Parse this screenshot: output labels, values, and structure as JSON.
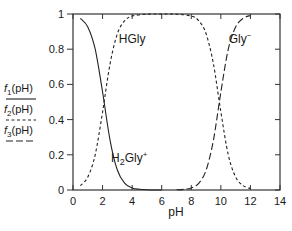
{
  "chart_data": {
    "type": "line",
    "title": "",
    "xlabel": "pH",
    "ylabel": "",
    "xlim": [
      0,
      14
    ],
    "ylim": [
      0,
      1
    ],
    "grid": false,
    "x_ticks": [
      0,
      2,
      4,
      6,
      8,
      10,
      12,
      14
    ],
    "y_ticks": [
      0,
      0.2,
      0.4,
      0.6,
      0.8,
      1
    ],
    "x_tick_labels": [
      "0",
      "2",
      "4",
      "6",
      "8",
      "10",
      "12",
      "14"
    ],
    "y_tick_labels": [
      "0",
      "0.2",
      "0.4",
      "0.6",
      "0.8",
      "1"
    ],
    "legend_position": "left-outside",
    "legend": [
      {
        "label_main": "f",
        "label_sub": "1",
        "label_rest": "(pH)",
        "style": "solid"
      },
      {
        "label_main": "f",
        "label_sub": "2",
        "label_rest": "(pH)",
        "style": "short-dash"
      },
      {
        "label_main": "f",
        "label_sub": "3",
        "label_rest": "(pH)",
        "style": "long-dash"
      }
    ],
    "annotations": [
      {
        "text_main": "HGly",
        "text_sub": "",
        "text_sup": "",
        "x_pH": 4.0,
        "y": 0.86
      },
      {
        "text_main": "Gly",
        "text_sub": "",
        "text_sup": "−",
        "x_pH": 11.3,
        "y": 0.86
      },
      {
        "text_main": "H",
        "text_sub": "2",
        "text_rest": "Gly",
        "text_sup": "+",
        "x_pH": 3.8,
        "y": 0.18
      }
    ],
    "series": [
      {
        "name": "f1(pH) — H2Gly+",
        "style": "solid",
        "x": [
          0.5,
          1.0,
          1.5,
          2.0,
          2.5,
          3.0,
          3.5,
          4.0,
          4.5,
          5.0,
          5.5,
          6.0
        ],
        "values": [
          0.975,
          0.926,
          0.8,
          0.557,
          0.285,
          0.112,
          0.038,
          0.012,
          0.004,
          0.001,
          0.0,
          0.0
        ]
      },
      {
        "name": "f2(pH) — HGly",
        "style": "short-dash",
        "x": [
          0.5,
          1.0,
          1.5,
          2.0,
          2.5,
          3.0,
          3.5,
          4.0,
          5.0,
          6.0,
          7.0,
          8.0,
          8.5,
          9.0,
          9.5,
          10.0,
          10.5,
          11.0,
          11.5,
          12.0
        ],
        "values": [
          0.025,
          0.074,
          0.2,
          0.443,
          0.715,
          0.888,
          0.962,
          0.988,
          0.999,
          1.0,
          0.999,
          0.988,
          0.962,
          0.888,
          0.715,
          0.443,
          0.2,
          0.074,
          0.025,
          0.008
        ]
      },
      {
        "name": "f3(pH) — Gly−",
        "style": "long-dash",
        "x": [
          7.0,
          7.5,
          8.0,
          8.5,
          9.0,
          9.5,
          10.0,
          10.5,
          11.0,
          11.5,
          12.0
        ],
        "values": [
          0.001,
          0.004,
          0.012,
          0.038,
          0.112,
          0.285,
          0.557,
          0.8,
          0.926,
          0.975,
          0.992
        ]
      }
    ]
  }
}
